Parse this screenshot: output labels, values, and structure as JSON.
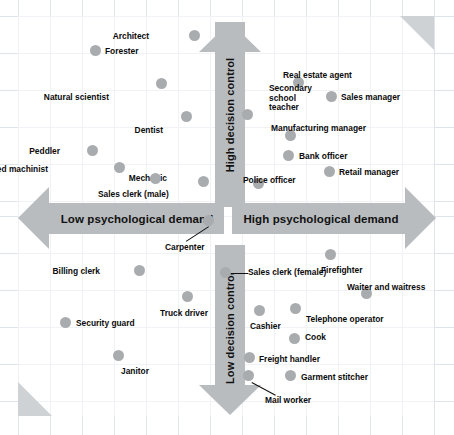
{
  "chart_data": {
    "type": "scatter",
    "title": "",
    "xlabel": "Psychological demand",
    "ylabel": "Decision control",
    "axis_labels": {
      "top": "High decision control",
      "bottom": "Low decision control",
      "left": "Low psychological demand",
      "right": "High psychological demand"
    },
    "xlim": [
      0,
      100
    ],
    "ylim": [
      0,
      100
    ],
    "grid": true,
    "legend": "none",
    "point_color": "#a9acaf",
    "arrow_color": "#b9bcbf",
    "quadrant_note": "Karasek demand-control model: occupations plotted by psychological demand (x) and decision control (y)",
    "points": [
      {
        "label": "Architect",
        "x": 43.0,
        "y": 95.5,
        "px": 194,
        "py": 35,
        "lx": 149,
        "ly": 32,
        "align": "right"
      },
      {
        "label": "Forester",
        "x": 21.5,
        "y": 88.0,
        "px": 95,
        "py": 50,
        "lx": 105,
        "ly": 47,
        "align": "left"
      },
      {
        "label": "Natural scientist",
        "x": 36.5,
        "y": 79.0,
        "px": 161,
        "py": 83,
        "lx": 109,
        "ly": 93,
        "align": "right"
      },
      {
        "label": "Dentist",
        "x": 42.0,
        "y": 70.5,
        "px": 186,
        "py": 116,
        "lx": 163,
        "ly": 126,
        "align": "right"
      },
      {
        "label": "Peddler",
        "x": 21.0,
        "y": 61.0,
        "px": 92,
        "py": 150,
        "lx": 60,
        "ly": 147,
        "align": "right"
      },
      {
        "label": "Skilled machinist",
        "x": 27.0,
        "y": 57.5,
        "px": 119,
        "py": 167,
        "lx": 48,
        "ly": 165,
        "align": "right"
      },
      {
        "label": "Mechanic",
        "x": 45.0,
        "y": 54.5,
        "px": 203,
        "py": 181,
        "lx": 167,
        "ly": 174,
        "align": "right"
      },
      {
        "label": "Sales clerk (male)",
        "x": 35.0,
        "y": 54.5,
        "px": 155,
        "py": 178,
        "lx": 98,
        "ly": 190,
        "align": "left"
      },
      {
        "label": "Real estate agent",
        "x": 53.0,
        "y": 82.0,
        "px": 298,
        "py": 82,
        "lx": 283,
        "ly": 71,
        "align": "left"
      },
      {
        "label": "Sales manager",
        "x": 62.0,
        "y": 78.0,
        "px": 331,
        "py": 96,
        "lx": 341,
        "ly": 93,
        "align": "left"
      },
      {
        "label": "Secondary school teacher",
        "x": 48.0,
        "y": 74.0,
        "px": 247,
        "py": 114,
        "lx": 269,
        "ly": 84,
        "align": "left",
        "multiline": true
      },
      {
        "label": "Manufacturing manager",
        "x": 52.0,
        "y": 70.0,
        "px": 290,
        "py": 135,
        "lx": 271,
        "ly": 124,
        "align": "left"
      },
      {
        "label": "Bank officer",
        "x": 51.5,
        "y": 64.0,
        "px": 288,
        "py": 155,
        "lx": 299,
        "ly": 152,
        "align": "left"
      },
      {
        "label": "Retail manager",
        "x": 61.0,
        "y": 60.0,
        "px": 329,
        "py": 171,
        "lx": 339,
        "ly": 168,
        "align": "left"
      },
      {
        "label": "Police officer",
        "x": 47.0,
        "y": 57.5,
        "px": 258,
        "py": 183,
        "lx": 243,
        "ly": 176,
        "align": "left"
      },
      {
        "label": "Carpenter",
        "x": 44.0,
        "y": 47.5,
        "px": 208,
        "py": 220,
        "lx": 165,
        "ly": 243,
        "align": "left",
        "leader": {
          "x1": 209,
          "y1": 227,
          "x2": 186,
          "y2": 242
        }
      },
      {
        "label": "Billing clerk",
        "x": 31.0,
        "y": 37.0,
        "px": 139,
        "py": 270,
        "lx": 100,
        "ly": 267,
        "align": "right"
      },
      {
        "label": "Truck driver",
        "x": 41.5,
        "y": 32.5,
        "px": 187,
        "py": 296,
        "lx": 160,
        "ly": 309,
        "align": "left"
      },
      {
        "label": "Security guard",
        "x": 15.0,
        "y": 28.5,
        "px": 65,
        "py": 322,
        "lx": 76,
        "ly": 319,
        "align": "left"
      },
      {
        "label": "Janitor",
        "x": 27.0,
        "y": 19.5,
        "px": 118,
        "py": 355,
        "lx": 121,
        "ly": 367,
        "align": "left"
      },
      {
        "label": "Firefighter",
        "x": 63.5,
        "y": 45.5,
        "px": 330,
        "py": 254,
        "lx": 321,
        "ly": 266,
        "align": "left"
      },
      {
        "label": "Sales clerk (female)",
        "x": 47.0,
        "y": 40.5,
        "px": 225,
        "py": 272,
        "lx": 248,
        "ly": 268,
        "align": "left",
        "leader": {
          "x1": 232,
          "y1": 273,
          "x2": 248,
          "y2": 273
        }
      },
      {
        "label": "Waiter and waitress",
        "x": 66.0,
        "y": 35.5,
        "px": 366,
        "py": 293,
        "lx": 347,
        "ly": 283,
        "align": "left"
      },
      {
        "label": "Cashier",
        "x": 50.0,
        "y": 33.5,
        "px": 259,
        "py": 310,
        "lx": 250,
        "ly": 322,
        "align": "left"
      },
      {
        "label": "Telephone operator",
        "x": 57.0,
        "y": 33.5,
        "px": 295,
        "py": 308,
        "lx": 306,
        "ly": 315,
        "align": "left"
      },
      {
        "label": "Cook",
        "x": 56.5,
        "y": 27.0,
        "px": 294,
        "py": 338,
        "lx": 305,
        "ly": 333,
        "align": "left"
      },
      {
        "label": "Freight handler",
        "x": 46.5,
        "y": 22.5,
        "px": 249,
        "py": 357,
        "lx": 259,
        "ly": 355,
        "align": "left"
      },
      {
        "label": "Garment stitcher",
        "x": 56.0,
        "y": 18.5,
        "px": 290,
        "py": 375,
        "lx": 301,
        "ly": 373,
        "align": "left"
      },
      {
        "label": "Mail worker",
        "x": 46.0,
        "y": 18.5,
        "px": 248,
        "py": 375,
        "lx": 265,
        "ly": 396,
        "align": "left",
        "leader": {
          "x1": 252,
          "y1": 382,
          "x2": 276,
          "y2": 395
        }
      }
    ]
  },
  "grid_lines": {
    "vertical_x": [
      18,
      50,
      82,
      114,
      146,
      178,
      210,
      242,
      274,
      306,
      338,
      370,
      402,
      434
    ],
    "horizontal_y": [
      16,
      53,
      90,
      127,
      164,
      201,
      216,
      253,
      290,
      327,
      364,
      401
    ]
  }
}
